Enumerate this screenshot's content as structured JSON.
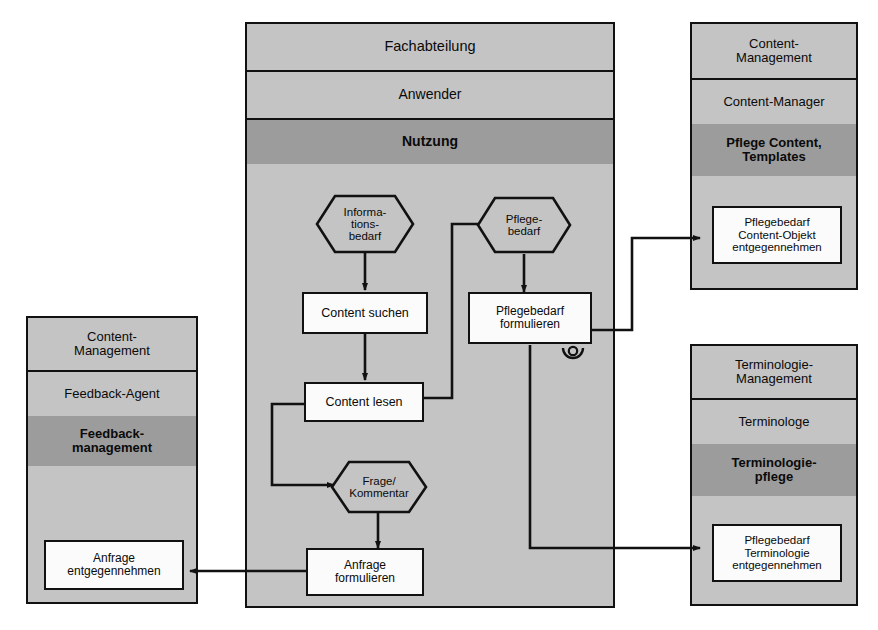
{
  "diagram": {
    "title_visible": false,
    "colors": {
      "lane_fill": "#c4c4c4",
      "lane_highlight_fill": "#9c9c9c",
      "node_fill": "#fbfbfb",
      "stroke": "#111111"
    }
  },
  "main_pool": {
    "organisation": "Fachabteilung",
    "role": "Anwender",
    "process": "Nutzung",
    "nodes": {
      "informationsbedarf": "Informations-bedarf",
      "informationsbedarf_lines": [
        "Informa-",
        "tions-",
        "bedarf"
      ],
      "content_suchen": "Content suchen",
      "content_lesen": "Content lesen",
      "frage_kommentar_lines": [
        "Frage/",
        "Kommentar"
      ],
      "anfrage_formulieren_lines": [
        "Anfrage",
        "formulieren"
      ],
      "pflegebedarf_lines": [
        "Pflege-",
        "bedarf"
      ],
      "pflegebedarf_formulieren_lines": [
        "Pflegebedarf",
        "formulieren"
      ]
    }
  },
  "left_pool": {
    "organisation": "Content-Management",
    "organisation_lines": [
      "Content-",
      "Management"
    ],
    "role": "Feedback-Agent",
    "process": "Feedbackmanagement",
    "process_lines": [
      "Feedback-",
      "management"
    ],
    "node_lines": [
      "Anfrage",
      "entgegennehmen"
    ]
  },
  "right_top_pool": {
    "organisation": "Content-Management",
    "organisation_lines": [
      "Content-",
      "Management"
    ],
    "role": "Content-Manager",
    "process": "Pflege Content, Templates",
    "process_lines": [
      "Pflege Content,",
      "Templates"
    ],
    "node_lines": [
      "Pflegebedarf",
      "Content-Objekt",
      "entgegennehmen"
    ]
  },
  "right_bottom_pool": {
    "organisation": "Terminologie-Management",
    "organisation_lines": [
      "Terminologie-",
      "Management"
    ],
    "role": "Terminologe",
    "process": "Terminologiepflege",
    "process_lines": [
      "Terminologie-",
      "pflege"
    ],
    "node_lines": [
      "Pflegebedarf",
      "Terminologie",
      "entgegennehmen"
    ]
  },
  "markers": {
    "line_jump": "line-jump-hop"
  }
}
